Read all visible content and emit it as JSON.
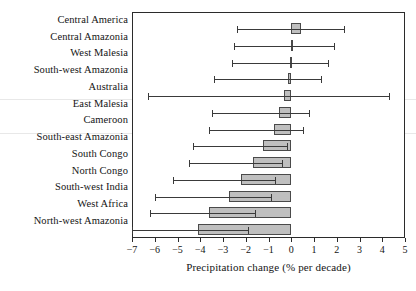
{
  "chart_data": {
    "type": "bar",
    "orientation": "horizontal",
    "title": "",
    "xlabel": "Precipitation change (% per decade)",
    "ylabel": "",
    "xlim": [
      -7,
      5
    ],
    "xticks": [
      -7,
      -6,
      -5,
      -4,
      -3,
      -2,
      -1,
      0,
      1,
      2,
      3,
      4,
      5
    ],
    "xticklabels": [
      "−7",
      "−6",
      "−5",
      "−4",
      "−3",
      "−2",
      "−1",
      "0",
      "1",
      "2",
      "3",
      "4",
      "5"
    ],
    "grid": false,
    "legend": null,
    "categories": [
      "Central America",
      "Central Amazonia",
      "West Malesia",
      "South-west Amazonia",
      "Australia",
      "East Malesia",
      "Cameroon",
      "South-east Amazonia",
      "South Congo",
      "North Congo",
      "South-west India",
      "West Africa",
      "North-west Amazonia"
    ],
    "values": [
      0.45,
      0.05,
      -0.05,
      -0.15,
      -0.3,
      -0.55,
      -0.75,
      -1.25,
      -1.7,
      -2.2,
      -2.75,
      -3.6,
      -4.1
    ],
    "error_low": [
      -2.4,
      -2.5,
      -2.6,
      -3.4,
      -6.3,
      -3.5,
      -3.6,
      -4.3,
      -4.5,
      -5.2,
      -6.0,
      -6.2,
      -7.0
    ],
    "error_high": [
      2.3,
      1.9,
      1.6,
      1.3,
      4.3,
      0.8,
      0.5,
      -0.2,
      -0.4,
      -0.7,
      -0.9,
      -1.6,
      -1.9
    ],
    "bar_color": "#bfbfbf",
    "bar_edge_color": "#4a4a4a",
    "error_color": "#3a3a3a"
  }
}
